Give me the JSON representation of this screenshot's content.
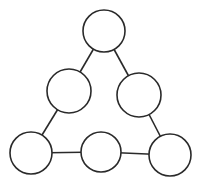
{
  "diagram": {
    "type": "triangle-node-graph",
    "stroke_color": "#2a2a2a",
    "fill_color": "#ffffff",
    "nodes": [
      {
        "id": "top",
        "cx": 104,
        "cy": 31,
        "r": 21,
        "label": ""
      },
      {
        "id": "mid-left",
        "cx": 69,
        "cy": 91,
        "r": 22,
        "label": ""
      },
      {
        "id": "mid-right",
        "cx": 139,
        "cy": 95,
        "r": 22,
        "label": ""
      },
      {
        "id": "bottom-left",
        "cx": 31,
        "cy": 153,
        "r": 21,
        "label": ""
      },
      {
        "id": "bottom-mid",
        "cx": 101,
        "cy": 152,
        "r": 20,
        "label": ""
      },
      {
        "id": "bottom-right",
        "cx": 170,
        "cy": 155,
        "r": 21,
        "label": ""
      }
    ],
    "edges": [
      {
        "from": "top",
        "to": "mid-left"
      },
      {
        "from": "top",
        "to": "mid-right"
      },
      {
        "from": "mid-left",
        "to": "bottom-left"
      },
      {
        "from": "mid-right",
        "to": "bottom-right"
      },
      {
        "from": "bottom-left",
        "to": "bottom-mid"
      },
      {
        "from": "bottom-mid",
        "to": "bottom-right"
      }
    ]
  }
}
